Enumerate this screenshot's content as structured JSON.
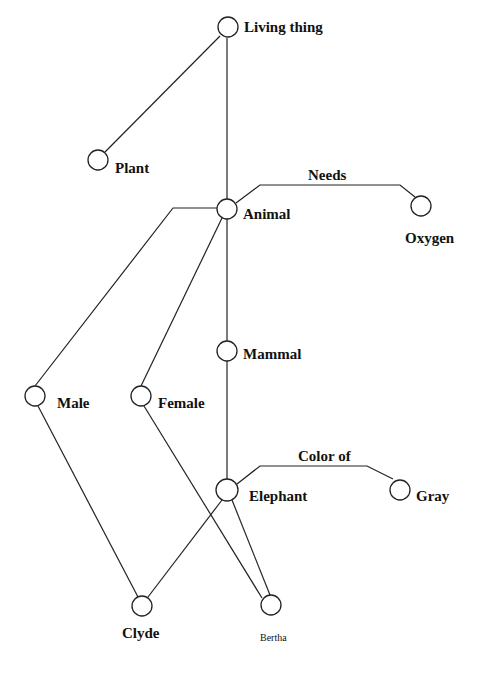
{
  "diagram": {
    "type": "semantic-network",
    "nodes": [
      {
        "id": "living_thing",
        "label": "Living thing",
        "x": 228,
        "y": 28,
        "lx": 244,
        "ly": 27
      },
      {
        "id": "plant",
        "label": "Plant",
        "x": 98,
        "y": 160,
        "lx": 115,
        "ly": 172
      },
      {
        "id": "animal",
        "label": "Animal",
        "x": 227,
        "y": 209,
        "lx": 242,
        "ly": 219
      },
      {
        "id": "oxygen",
        "label": "Oxygen",
        "x": 421,
        "y": 206,
        "lx": 404,
        "ly": 243
      },
      {
        "id": "mammal",
        "label": "Mammal",
        "x": 227,
        "y": 351,
        "lx": 243,
        "ly": 359
      },
      {
        "id": "male",
        "label": "Male",
        "x": 35,
        "y": 396,
        "lx": 57,
        "ly": 408
      },
      {
        "id": "female",
        "label": "Female",
        "x": 141,
        "y": 396,
        "lx": 158,
        "ly": 408
      },
      {
        "id": "elephant",
        "label": "Elephant",
        "x": 227,
        "y": 490,
        "lx": 249,
        "ly": 501
      },
      {
        "id": "gray",
        "label": "Gray",
        "x": 400,
        "y": 490,
        "lx": 416,
        "ly": 501
      },
      {
        "id": "clyde",
        "label": "Clyde",
        "x": 142,
        "y": 606,
        "lx": 122,
        "ly": 638
      },
      {
        "id": "bertha",
        "label": "Bertha",
        "x": 271,
        "y": 605,
        "lx": 260,
        "ly": 640
      }
    ],
    "edges": [
      {
        "from": "living_thing",
        "to": "plant",
        "label": ""
      },
      {
        "from": "living_thing",
        "to": "animal",
        "label": ""
      },
      {
        "from": "animal",
        "to": "oxygen",
        "label": "Needs"
      },
      {
        "from": "animal",
        "to": "mammal",
        "label": ""
      },
      {
        "from": "animal",
        "to": "male",
        "label": ""
      },
      {
        "from": "animal",
        "to": "female",
        "label": ""
      },
      {
        "from": "mammal",
        "to": "elephant",
        "label": ""
      },
      {
        "from": "elephant",
        "to": "gray",
        "label": "Color of"
      },
      {
        "from": "elephant",
        "to": "clyde",
        "label": ""
      },
      {
        "from": "elephant",
        "to": "bertha",
        "label": ""
      },
      {
        "from": "male",
        "to": "clyde",
        "label": ""
      },
      {
        "from": "female",
        "to": "bertha",
        "label": ""
      }
    ],
    "edge_labels": {
      "needs": "Needs",
      "color_of": "Color of"
    }
  }
}
